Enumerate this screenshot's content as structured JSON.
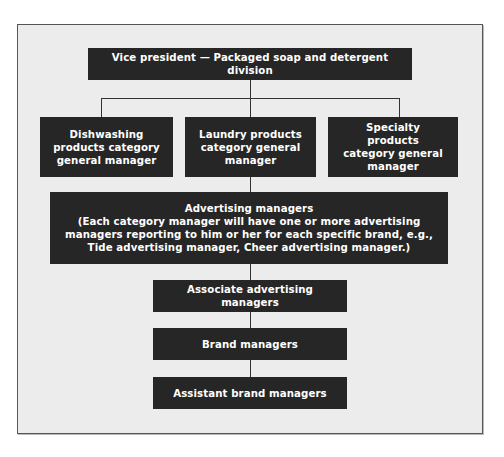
{
  "diagram": {
    "type": "org-chart",
    "colors": {
      "box_fill": "#262626",
      "box_text": "#ffffff",
      "background": "#ececec",
      "connector": "#333333"
    },
    "nodes": {
      "vp": {
        "label": "Vice president — Packaged soap and detergent division"
      },
      "dishwashing": {
        "label": "Dishwashing products category general manager"
      },
      "laundry": {
        "label": "Laundry products category general manager"
      },
      "specialty": {
        "label": "Specialty products category general manager"
      },
      "advertising": {
        "title": "Advertising managers",
        "note": "(Each category manager will have one or more advertising managers reporting to him or her for each specific brand, e.g., Tide advertising manager, Cheer advertising manager.)"
      },
      "associate_advertising": {
        "label": "Associate advertising managers"
      },
      "brand": {
        "label": "Brand managers"
      },
      "assistant_brand": {
        "label": "Assistant brand managers"
      }
    },
    "edges": [
      [
        "vp",
        "dishwashing"
      ],
      [
        "vp",
        "laundry"
      ],
      [
        "vp",
        "specialty"
      ],
      [
        "laundry",
        "advertising"
      ],
      [
        "advertising",
        "associate_advertising"
      ],
      [
        "associate_advertising",
        "brand"
      ],
      [
        "brand",
        "assistant_brand"
      ]
    ]
  }
}
